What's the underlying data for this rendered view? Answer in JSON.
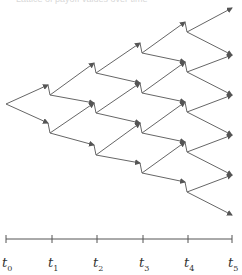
{
  "header": {
    "cut_text": "Lattice of payoff values over time"
  },
  "diagram": {
    "type": "recombining binomial tree",
    "stroke_color": "#555555",
    "root": [
      6,
      104
    ],
    "nodes": {
      "t0": [
        [
          6,
          104
        ]
      ],
      "t1": [
        [
          48,
          85
        ],
        [
          48,
          123
        ]
      ],
      "t2": [
        [
          94,
          63
        ],
        [
          94,
          103
        ],
        [
          94,
          145
        ]
      ],
      "t3": [
        [
          140,
          43
        ],
        [
          140,
          83
        ],
        [
          140,
          123
        ],
        [
          140,
          163
        ]
      ],
      "t4": [
        [
          185,
          22
        ],
        [
          185,
          62
        ],
        [
          185,
          102
        ],
        [
          185,
          142
        ],
        [
          185,
          182
        ]
      ],
      "t5": [
        [
          232,
          8
        ],
        [
          232,
          55
        ],
        [
          232,
          95
        ],
        [
          232,
          135
        ],
        [
          232,
          175
        ],
        [
          232,
          215
        ]
      ]
    }
  },
  "axis": {
    "y": 239,
    "x_start": 6,
    "x_end": 232,
    "ticks": [
      {
        "x": 6,
        "base": "t",
        "sub": "0"
      },
      {
        "x": 52,
        "base": "t",
        "sub": "1"
      },
      {
        "x": 97,
        "base": "t",
        "sub": "2"
      },
      {
        "x": 143,
        "base": "t",
        "sub": "3"
      },
      {
        "x": 188,
        "base": "t",
        "sub": "4"
      },
      {
        "x": 232,
        "base": "t",
        "sub": "5"
      }
    ]
  }
}
